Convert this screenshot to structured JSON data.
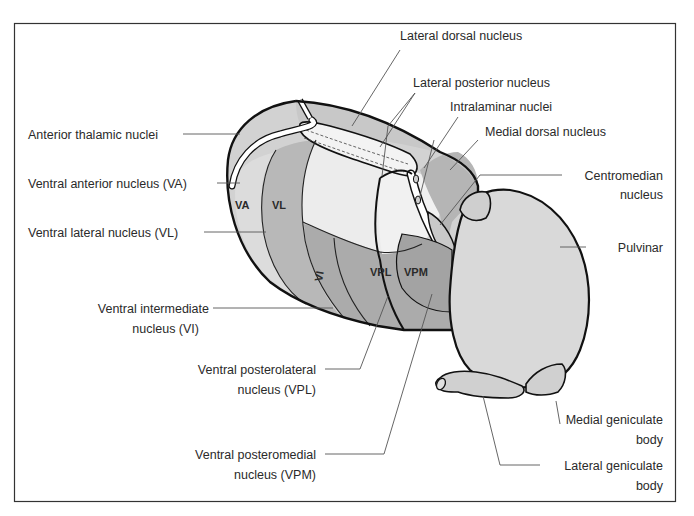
{
  "figure": {
    "title": "Thalamic nuclei",
    "colors": {
      "frame": "#333333",
      "outline": "#111111",
      "anterior": "#d2d2d2",
      "va": "#dcdcdc",
      "vl": "#b8b8b8",
      "vi": "#b0b0b0",
      "posterior_ventral": "#a9a9a9",
      "lateral_posterior": "#ececec",
      "lateral_dorsal": "#f0f0f0",
      "medial_dorsal": "#b5b5b5",
      "pulvinar": "#d9d9d9",
      "lamina": "#ffffff"
    }
  },
  "regions": {
    "va": "VA",
    "vl": "VL",
    "vi": "VI",
    "vpl": "VPL",
    "vpm": "VPM"
  },
  "labels": {
    "lateral_dorsal": "Lateral dorsal nucleus",
    "lateral_posterior": "Lateral posterior nucleus",
    "intralaminar": "Intralaminar nuclei",
    "medial_dorsal": "Medial dorsal nucleus",
    "centromedian_1": "Centromedian",
    "centromedian_2": "nucleus",
    "pulvinar": "Pulvinar",
    "anterior_thalamic": "Anterior thalamic nuclei",
    "ventral_anterior": "Ventral anterior nucleus (VA)",
    "ventral_lateral": "Ventral lateral nucleus (VL)",
    "ventral_intermediate_1": "Ventral intermediate",
    "ventral_intermediate_2": "nucleus (VI)",
    "vpl_1": "Ventral posterolateral",
    "vpl_2": "nucleus (VPL)",
    "vpm_1": "Ventral posteromedial",
    "vpm_2": "nucleus (VPM)",
    "medial_geniculate_1": "Medial geniculate",
    "medial_geniculate_2": "body",
    "lateral_geniculate_1": "Lateral geniculate",
    "lateral_geniculate_2": "body"
  }
}
